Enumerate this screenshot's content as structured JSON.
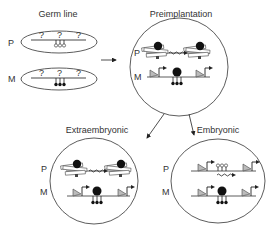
{
  "panels": {
    "germline": {
      "title": "Germ line",
      "row_p": "P",
      "row_m": "M",
      "unknown_mark": "?"
    },
    "preimplantation": {
      "title": "Preimplantation",
      "row_p": "P",
      "row_m": "M"
    },
    "extraembryonic": {
      "title": "Extraembryonic",
      "row_p": "P",
      "row_m": "M"
    },
    "embryonic": {
      "title": "Embryonic",
      "row_p": "P",
      "row_m": "M"
    }
  },
  "legend_semantics": {
    "open_lollipop": "unmethylated CpG",
    "filled_lollipop": "methylated CpG",
    "triangle_arrow": "active promoter",
    "wavy_arrow": "noncoding transcript",
    "black_circle": "bound repressor"
  },
  "colors": {
    "stroke": "#333333",
    "fill_dark": "#111111",
    "fill_light": "#ffffff",
    "triangle": "#bbbbbb"
  }
}
